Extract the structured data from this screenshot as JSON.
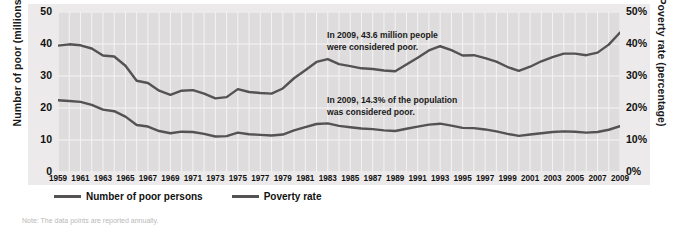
{
  "chart_data": {
    "type": "line",
    "title": "",
    "xlabel": "",
    "ylabel": "Number of poor (millions)",
    "y2label": "Poverty rate (percentage)",
    "grid": true,
    "legend_position": "bottom-left",
    "xlim": [
      1959,
      2009
    ],
    "ylim": [
      0,
      50
    ],
    "y2lim": [
      0,
      50
    ],
    "x_tick_labels": [
      "1959",
      "1961",
      "1963",
      "1965",
      "1967",
      "1969",
      "1971",
      "1973",
      "1975",
      "1977",
      "1979",
      "1981",
      "1983",
      "1985",
      "1987",
      "1989",
      "1991",
      "1993",
      "1995",
      "1997",
      "1999",
      "2001",
      "2003",
      "2005",
      "2007",
      "2009"
    ],
    "y_tick_labels": [
      "0",
      "10",
      "20",
      "30",
      "40",
      "50"
    ],
    "y2_tick_labels": [
      "0%",
      "10%",
      "20%",
      "30%",
      "40%",
      "50%"
    ],
    "x": [
      1959,
      1960,
      1961,
      1962,
      1963,
      1964,
      1965,
      1966,
      1967,
      1968,
      1969,
      1970,
      1971,
      1972,
      1973,
      1974,
      1975,
      1976,
      1977,
      1978,
      1979,
      1980,
      1981,
      1982,
      1983,
      1984,
      1985,
      1986,
      1987,
      1988,
      1989,
      1990,
      1991,
      1992,
      1993,
      1994,
      1995,
      1996,
      1997,
      1998,
      1999,
      2000,
      2001,
      2002,
      2003,
      2004,
      2005,
      2006,
      2007,
      2008,
      2009
    ],
    "series": [
      {
        "name": "Number of poor persons",
        "axis": "left",
        "unit": "millions",
        "color": "#555253",
        "values": [
          39.5,
          39.9,
          39.6,
          38.6,
          36.4,
          36.1,
          33.2,
          28.5,
          27.8,
          25.4,
          24.1,
          25.4,
          25.6,
          24.5,
          23.0,
          23.4,
          25.9,
          25.0,
          24.7,
          24.5,
          26.1,
          29.3,
          31.8,
          34.4,
          35.3,
          33.7,
          33.1,
          32.4,
          32.2,
          31.7,
          31.5,
          33.6,
          35.7,
          38.0,
          39.3,
          38.1,
          36.4,
          36.5,
          35.6,
          34.5,
          32.8,
          31.6,
          32.9,
          34.6,
          35.9,
          37.0,
          37.0,
          36.5,
          37.3,
          39.8,
          43.6
        ]
      },
      {
        "name": "Poverty rate",
        "axis": "right",
        "unit": "percent",
        "color": "#555253",
        "values": [
          22.4,
          22.2,
          21.9,
          21.0,
          19.5,
          19.0,
          17.3,
          14.7,
          14.2,
          12.8,
          12.1,
          12.6,
          12.5,
          11.9,
          11.1,
          11.2,
          12.3,
          11.8,
          11.6,
          11.4,
          11.7,
          13.0,
          14.0,
          15.0,
          15.2,
          14.4,
          14.0,
          13.6,
          13.4,
          13.0,
          12.8,
          13.5,
          14.2,
          14.8,
          15.1,
          14.5,
          13.8,
          13.7,
          13.3,
          12.7,
          11.9,
          11.3,
          11.7,
          12.1,
          12.5,
          12.7,
          12.6,
          12.3,
          12.5,
          13.2,
          14.3
        ]
      }
    ],
    "annotations": [
      {
        "id": "annot-millions",
        "line1": "In 2009, 43.6 million people",
        "line2": "were considered poor."
      },
      {
        "id": "annot-rate",
        "line1": "In 2009, 14.3% of the population",
        "line2": "was considered poor."
      }
    ]
  },
  "legend": {
    "items": [
      {
        "label": "Number of poor persons"
      },
      {
        "label": "Poverty rate"
      }
    ]
  },
  "note": {
    "text": "Note: The data points are reported annually."
  },
  "colors": {
    "line": "#555253",
    "plot_background": "#dedcdc",
    "frame_background": "#eceaea",
    "gridline": "#f5f4f4"
  }
}
